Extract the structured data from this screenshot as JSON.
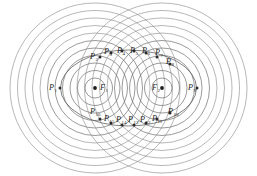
{
  "figure": {
    "canvas": {
      "width": 257,
      "height": 176
    },
    "colors": {
      "circle_stroke": "#8a8a8a",
      "ellipse_stroke": "#5a5a5a",
      "point_fill": "#2b2b2b",
      "focus_fill": "#1c1c1c",
      "label_fill": "#1f1f1f",
      "background": "#ffffff"
    },
    "ellipse": {
      "cx": 128.5,
      "cy": 88,
      "rx": 68,
      "ry": 38
    },
    "circle_families": [
      {
        "name": "left-focus-circles",
        "cx": 95,
        "cy": 88,
        "radii": [
          10,
          17.5,
          25,
          32.5,
          40,
          47.5,
          55,
          62.5,
          70,
          77.5,
          85
        ]
      },
      {
        "name": "right-focus-circles",
        "cx": 162,
        "cy": 88,
        "radii": [
          10,
          17.5,
          25,
          32.5,
          40,
          47.5,
          55,
          62.5,
          70,
          77.5,
          85
        ]
      }
    ],
    "foci": [
      {
        "id": "F1",
        "label": "F",
        "sub": "1",
        "x": 95,
        "y": 88,
        "label_x": 100,
        "label_y": 90
      },
      {
        "id": "F2",
        "label": "F",
        "sub": "2",
        "x": 162,
        "y": 88,
        "label_x": 152,
        "label_y": 90
      }
    ],
    "points": [
      {
        "id": "P1",
        "label": "P",
        "sub": "1",
        "x": 60,
        "y": 88,
        "label_x": 49,
        "label_y": 90
      },
      {
        "id": "P2",
        "label": "P",
        "sub": "2",
        "x": 100,
        "y": 57,
        "label_x": 90,
        "label_y": 59
      },
      {
        "id": "P3",
        "label": "P",
        "sub": "3",
        "x": 111,
        "y": 53,
        "label_x": 104,
        "label_y": 54
      },
      {
        "id": "P4",
        "label": "P",
        "sub": "4",
        "x": 122,
        "y": 51,
        "label_x": 117,
        "label_y": 53
      },
      {
        "id": "P5",
        "label": "P",
        "sub": "5",
        "x": 134,
        "y": 51,
        "label_x": 130,
        "label_y": 53
      },
      {
        "id": "P6",
        "label": "P",
        "sub": "6",
        "x": 146,
        "y": 53,
        "label_x": 142,
        "label_y": 53
      },
      {
        "id": "P7",
        "label": "P",
        "sub": "7",
        "x": 157,
        "y": 57,
        "label_x": 155,
        "label_y": 55
      },
      {
        "id": "P8",
        "label": "P",
        "sub": "8",
        "x": 170,
        "y": 64,
        "label_x": 166,
        "label_y": 64
      },
      {
        "id": "P9",
        "label": "P",
        "sub": "9",
        "x": 197,
        "y": 88,
        "label_x": 188,
        "label_y": 90
      },
      {
        "id": "P10",
        "label": "P",
        "sub": "10",
        "x": 170,
        "y": 113,
        "label_x": 168,
        "label_y": 114
      },
      {
        "id": "P11",
        "label": "P",
        "sub": "11",
        "x": 157,
        "y": 119,
        "label_x": 152,
        "label_y": 121
      },
      {
        "id": "P12",
        "label": "P",
        "sub": "12",
        "x": 146,
        "y": 123,
        "label_x": 140,
        "label_y": 122
      },
      {
        "id": "P13",
        "label": "P",
        "sub": "13",
        "x": 134,
        "y": 125,
        "label_x": 128,
        "label_y": 122
      },
      {
        "id": "P14",
        "label": "P",
        "sub": "14",
        "x": 122,
        "y": 125,
        "label_x": 116,
        "label_y": 122
      },
      {
        "id": "P15",
        "label": "P",
        "sub": "15",
        "x": 111,
        "y": 123,
        "label_x": 104,
        "label_y": 121
      },
      {
        "id": "P16",
        "label": "P",
        "sub": "16",
        "x": 100,
        "y": 119,
        "label_x": 90,
        "label_y": 114
      }
    ]
  }
}
